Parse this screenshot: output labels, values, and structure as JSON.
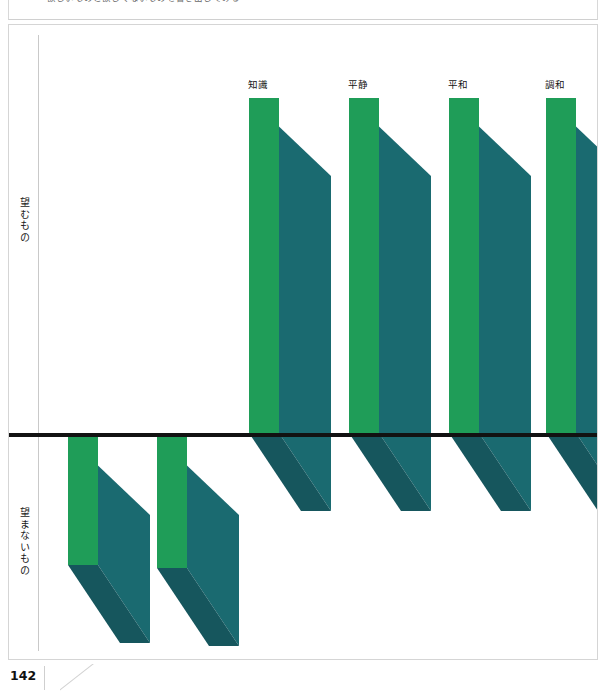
{
  "page": {
    "number": "142",
    "caption": "欲しいものと欲しくないものを書き出してみる"
  },
  "axis": {
    "upper_label": "望むもの",
    "lower_label": "望まないもの"
  },
  "colors": {
    "bar_front": "#1f9d58",
    "bar_side": "#1a6a70",
    "bar_side_dark": "#16565d",
    "baseline": "#121212",
    "axis": "#c9c9c9",
    "frame": "#d5d5d5",
    "text": "#1a1a1a"
  },
  "chart_data": {
    "type": "bar",
    "title": "",
    "subtitle": "",
    "xlabel": "",
    "ylabel": "望むもの / 望まないもの",
    "orientation": "vertical",
    "grid": false,
    "legend": false,
    "baseline": 0,
    "ylim": [
      -5,
      10
    ],
    "categories": [
      "冒険",
      "興奮",
      "知識",
      "平静",
      "平和",
      "調和"
    ],
    "values": [
      -2.6,
      -3.6,
      9.0,
      9.0,
      9.0,
      9.0
    ],
    "tick_labels": [],
    "annotations": [
      {
        "label": "冒険",
        "value": -2.6,
        "position": "below-axis"
      },
      {
        "label": "興奮",
        "value": -3.6,
        "position": "below-axis"
      },
      {
        "label": "知識",
        "value": 9.0,
        "position": "above-axis"
      },
      {
        "label": "平静",
        "value": 9.0,
        "position": "above-axis"
      },
      {
        "label": "平和",
        "value": 9.0,
        "position": "above-axis"
      },
      {
        "label": "調和",
        "value": 9.0,
        "position": "above-axis"
      }
    ]
  },
  "bars": [
    {
      "label": "冒険",
      "label_x": 88,
      "label_y": 634,
      "front_x": 59,
      "front_w": 30,
      "top_y": 412,
      "bottom_y": 540,
      "depth_x": 52,
      "depth_y": 78
    },
    {
      "label": "興奮",
      "label_x": 177,
      "label_y": 634,
      "front_x": 148,
      "front_w": 30,
      "top_y": 412,
      "bottom_y": 543,
      "depth_x": 52,
      "depth_y": 78
    },
    {
      "label": "知識",
      "label_x": 249,
      "label_y": 52,
      "front_x": 240,
      "front_w": 30,
      "top_y": 73,
      "bottom_y": 408,
      "depth_x": 52,
      "depth_y": 78
    },
    {
      "label": "平静",
      "label_x": 349,
      "label_y": 52,
      "front_x": 340,
      "front_w": 30,
      "top_y": 73,
      "bottom_y": 408,
      "depth_x": 52,
      "depth_y": 78
    },
    {
      "label": "平和",
      "label_x": 449,
      "label_y": 52,
      "front_x": 440,
      "front_w": 30,
      "top_y": 73,
      "bottom_y": 408,
      "depth_x": 52,
      "depth_y": 78
    },
    {
      "label": "調和",
      "label_x": 546,
      "label_y": 52,
      "front_x": 537,
      "front_w": 30,
      "top_y": 73,
      "bottom_y": 408,
      "depth_x": 52,
      "depth_y": 78
    }
  ]
}
